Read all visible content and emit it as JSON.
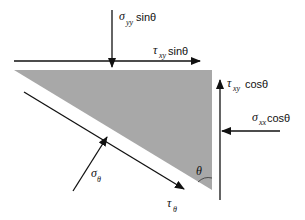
{
  "diagram": {
    "colors": {
      "element_fill": "#a8a8a8",
      "arrow": "#111111",
      "background": "#ffffff"
    },
    "element": {
      "shape": "right-triangle",
      "vertices": [
        [
          14,
          70
        ],
        [
          212,
          70
        ],
        [
          212,
          190
        ]
      ]
    },
    "labels": {
      "sigma_yy_sin": {
        "symbol": "σ",
        "sub": "yy",
        "func": "sinθ"
      },
      "tau_xy_sin": {
        "symbol": "τ",
        "sub": "xy",
        "func": "sinθ"
      },
      "tau_xy_cos": {
        "symbol": "τ",
        "sub": "xy",
        "func": "cosθ"
      },
      "sigma_xx_cos": {
        "symbol": "σ",
        "sub": "xx",
        "func": "cosθ"
      },
      "sigma_theta": {
        "symbol": "σ",
        "sub": "θ"
      },
      "tau_theta": {
        "symbol": "τ",
        "sub": "θ"
      },
      "theta": {
        "symbol": "θ"
      }
    }
  }
}
